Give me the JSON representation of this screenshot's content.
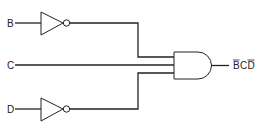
{
  "diagram": {
    "type": "logic-circuit",
    "inputs": [
      {
        "name": "B",
        "label": "B",
        "inverted": true
      },
      {
        "name": "C",
        "label": "C",
        "inverted": false
      },
      {
        "name": "D",
        "label": "D",
        "inverted": true
      }
    ],
    "gate": {
      "type": "AND",
      "inputs": 3
    },
    "output": {
      "label_parts": [
        "B",
        "C",
        "D"
      ],
      "overbar": [
        true,
        false,
        true
      ],
      "expression": "B̄CD̄"
    },
    "colors": {
      "line": "#222222",
      "background": "#ffffff"
    }
  }
}
